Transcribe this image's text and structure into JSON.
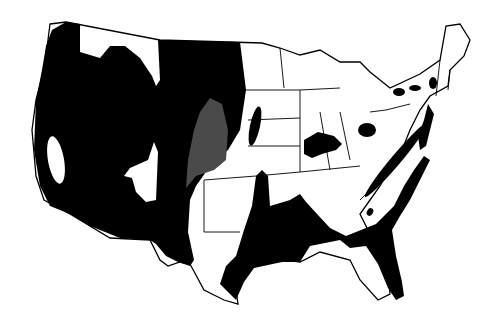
{
  "map": {
    "subject": "Contiguous United States",
    "style": "black and white regional shading map",
    "colors": {
      "background": "#ffffff",
      "region_fill": "#000000",
      "stippled_fill": "#4a4a4a",
      "border": "#000000"
    },
    "legend": null,
    "labels": []
  }
}
